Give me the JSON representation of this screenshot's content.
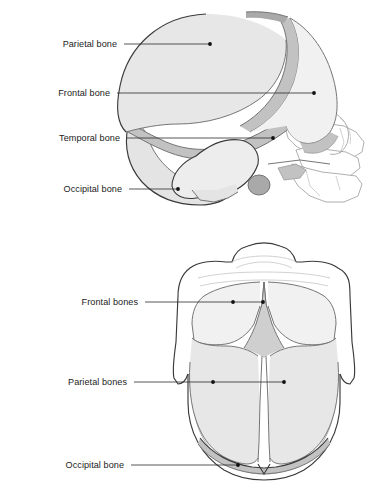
{
  "figure": {
    "background_color": "#ffffff",
    "label_color": "#1b1b1b",
    "leader_color": "#2b2b2b"
  },
  "palette": {
    "parietal_fill": "#e7e7e7",
    "frontal_fill": "#f1f1f1",
    "temporal_fill": "#ededed",
    "occipital_fill": "#e4e4e4",
    "suture_fill": "#c2c2c2",
    "fontanelle_fill": "#cfcfcf",
    "face_fill": "#ffffff",
    "outline_strong": "#3a3a3a",
    "outline_mid": "#6f6f6f",
    "outline_soft": "#9b9b9b"
  },
  "panels": [
    {
      "id": "lateral-view",
      "name": "lateral-skull-view",
      "view": "lateral",
      "labels": [
        {
          "id": "parietal",
          "text": "Parietal bone",
          "text_x": 117,
          "text_y": 47,
          "line_x1": 124,
          "line_y1": 44,
          "line_x2": 210,
          "line_y2": 44,
          "dot_x": 210,
          "dot_y": 44
        },
        {
          "id": "frontal",
          "text": "Frontal bone",
          "text_x": 110,
          "text_y": 96,
          "line_x1": 117,
          "line_y1": 93,
          "line_x2": 314,
          "line_y2": 93,
          "dot_x": 314,
          "dot_y": 93
        },
        {
          "id": "temporal",
          "text": "Temporal bone",
          "text_x": 120,
          "text_y": 141,
          "line_x1": 127,
          "line_y1": 138,
          "line_x2": 273,
          "line_y2": 138,
          "dot_x": 273,
          "dot_y": 138
        },
        {
          "id": "occipital",
          "text": "Occipital bone",
          "text_x": 122,
          "text_y": 192,
          "line_x1": 129,
          "line_y1": 189,
          "line_x2": 178,
          "line_y2": 189,
          "dot_x": 178,
          "dot_y": 189
        }
      ]
    },
    {
      "id": "superior-view",
      "name": "superior-skull-view",
      "view": "superior",
      "labels": [
        {
          "id": "frontal-bones",
          "text": "Frontal bones",
          "text_x": 138,
          "text_y": 73,
          "line_x1": 145,
          "line_y1": 70,
          "line_x2": 263,
          "line_y2": 70,
          "dot_x": 233,
          "dot_y": 70,
          "dot2_x": 263,
          "dot2_y": 70
        },
        {
          "id": "parietal-bones",
          "text": "Parietal bones",
          "text_x": 127,
          "text_y": 153,
          "line_x1": 134,
          "line_y1": 150,
          "line_x2": 284,
          "line_y2": 150,
          "dot_x": 213,
          "dot_y": 150,
          "dot2_x": 284,
          "dot2_y": 150
        },
        {
          "id": "occipital-bone",
          "text": "Occipital bone",
          "text_x": 124,
          "text_y": 236,
          "line_x1": 131,
          "line_y1": 233,
          "line_x2": 238,
          "line_y2": 233,
          "dot_x": 238,
          "dot_y": 233
        }
      ]
    }
  ],
  "anatomy_terms": [
    "Parietal bone",
    "Frontal bone",
    "Temporal bone",
    "Occipital bone",
    "Frontal bones",
    "Parietal bones",
    "Occipital bone"
  ]
}
